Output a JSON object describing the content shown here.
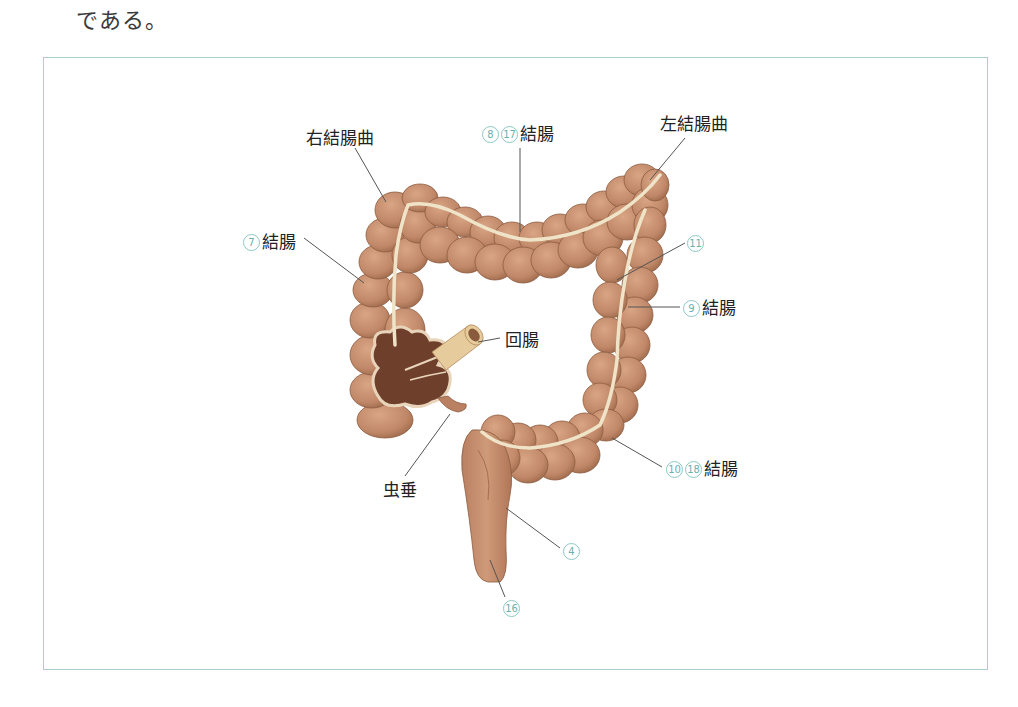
{
  "lead_text": "である。",
  "diagram": {
    "colors": {
      "frame_border": "#a9cfcf",
      "number_circle": "#6bb0ac",
      "colon_fill": "#c48d6a",
      "colon_shade": "#a8704f",
      "taenia_band": "#efe3c8",
      "ileum_fill": "#e8cfa0",
      "leader_line": "#555555"
    },
    "labels": {
      "right_flexure": {
        "text": "右結腸曲"
      },
      "transverse": {
        "nums": [
          "8",
          "17"
        ],
        "text": "結腸"
      },
      "left_flexure": {
        "text": "左結腸曲"
      },
      "ascending": {
        "nums": [
          "7"
        ],
        "text": "結腸"
      },
      "taenia": {
        "nums": [
          "11"
        ],
        "text": ""
      },
      "descending": {
        "nums": [
          "9"
        ],
        "text": "結腸"
      },
      "ileum": {
        "text": "回腸"
      },
      "appendix": {
        "text": "虫垂"
      },
      "sigmoid": {
        "nums": [
          "10",
          "18"
        ],
        "text": "結腸"
      },
      "rectum": {
        "nums": [
          "4"
        ],
        "text": ""
      },
      "anus": {
        "nums": [
          "16"
        ],
        "text": ""
      }
    }
  }
}
